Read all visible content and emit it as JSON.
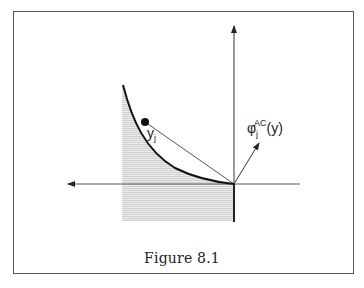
{
  "figure": {
    "caption": "Figure 8.1",
    "labels": {
      "point_label_base": "y",
      "point_label_sub": "j",
      "vector_label_base": "φ",
      "vector_label_sub": "j",
      "vector_label_sup": "AC",
      "vector_label_arg": "(y)"
    },
    "colors": {
      "frame": "#555555",
      "axes": "#555555",
      "curve": "#111111",
      "shading": "#d6d6d6",
      "text": "#222222"
    },
    "elements": {
      "axes": "vertical axis with upward arrow and horizontal axis with leftward arrow, origin at right-center",
      "curve": "convex decreasing curve ending at the origin",
      "point": "filled dot on curve labeled y_j",
      "chord": "straight line from y_j to origin",
      "vector": "arrow from origin pointing up-right labeled φ_j^AC(y)",
      "shaded_region": "dotted gray region under curve to the left of the origin, extending below the horizontal axis"
    }
  }
}
